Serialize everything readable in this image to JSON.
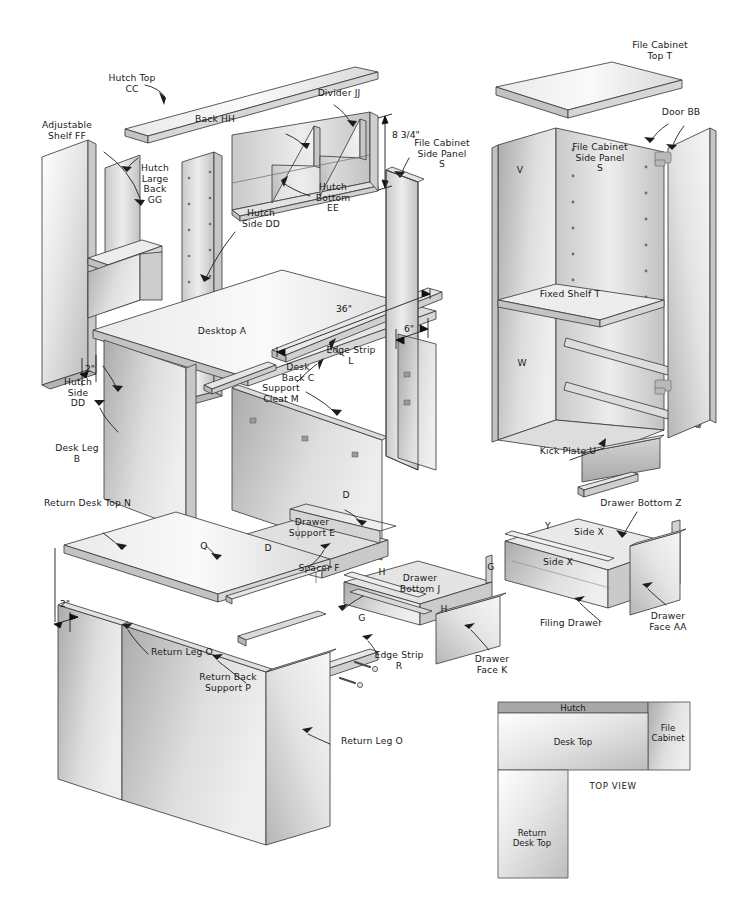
{
  "document": {
    "title": "Desk Assembly Exploded View",
    "top_view_caption": "TOP VIEW"
  },
  "colors": {
    "ink": "#1a1a1a",
    "line": "#4a4a4a",
    "panel_light": "#f2f2f2",
    "panel_mid": "#d9d9d9",
    "panel_dark": "#b4b4b4",
    "background": "#ffffff"
  },
  "labels": {
    "hutch_top": "Hutch Top\nCC",
    "divider": "Divider JJ",
    "back": "Back HH",
    "adjustable_shelf": "Adjustable\nShelf FF",
    "hutch_large_back": "Hutch\nLarge\nBack\nGG",
    "hutch_side_dd_left": "Hutch\nSide\nDD",
    "hutch_side_dd_mid": "Hutch\nSide DD",
    "hutch_bottom": "Hutch\nBottom\nEE",
    "file_cabinet_top": "File Cabinet\nTop T",
    "file_cabinet_side_panel_left": "File Cabinet\nSide Panel\nS",
    "file_cabinet_side_panel_right": "File Cabinet\nSide Panel\nS",
    "door": "Door BB",
    "panel_v": "V",
    "panel_w": "W",
    "fixed_shelf": "Fixed Shelf T",
    "kick_plate": "Kick Plate U",
    "desktop": "Desktop A",
    "edge_strip_l": "Edge Strip\nL",
    "support_cleat": "Support\nCleat M",
    "desk_back": "Desk\nBack C",
    "desk_leg": "Desk Leg\nB",
    "return_desk_top": "Return Desk Top N",
    "label_q": "Q",
    "return_leg_o_upper": "Return Leg O",
    "return_back_support": "Return Back\nSupport P",
    "return_leg_o_lower": "Return Leg O",
    "drawer_support": "Drawer\nSupport E",
    "label_d_top": "D",
    "label_d_side": "D",
    "spacer": "Spacer F",
    "drawer_bottom_j": "Drawer\nBottom J",
    "label_h_top": "H",
    "label_h_bottom": "H",
    "label_g_right": "G",
    "label_g_left": "G",
    "edge_strip_r": "Edge Strip\nR",
    "drawer_face_k": "Drawer\nFace K",
    "drawer_bottom_z": "Drawer Bottom Z",
    "side_x_upper": "Side X",
    "side_x_lower": "Side X",
    "label_y": "Y",
    "filing_drawer": "Filing Drawer",
    "drawer_face_aa": "Drawer\nFace AA"
  },
  "dimensions": {
    "hutch_opening_height": "8 3/4\"",
    "desktop_length": "36\"",
    "file_cabinet_gap": "6\"",
    "hutch_side_thickness": "2\"",
    "return_top_thickness": "2\""
  },
  "top_view": {
    "caption": "TOP VIEW",
    "parts": {
      "hutch": "Hutch",
      "desk_top": "Desk Top",
      "file_cabinet": "File\nCabinet",
      "return_desk_top": "Return\nDesk Top"
    }
  },
  "parts_list": [
    {
      "code": "A",
      "name": "Desktop"
    },
    {
      "code": "B",
      "name": "Desk Leg"
    },
    {
      "code": "C",
      "name": "Desk Back"
    },
    {
      "code": "D",
      "name": "Drawer Support side"
    },
    {
      "code": "E",
      "name": "Drawer Support"
    },
    {
      "code": "F",
      "name": "Spacer"
    },
    {
      "code": "G",
      "name": "Drawer side rail"
    },
    {
      "code": "H",
      "name": "Drawer side"
    },
    {
      "code": "J",
      "name": "Drawer Bottom"
    },
    {
      "code": "K",
      "name": "Drawer Face"
    },
    {
      "code": "L",
      "name": "Edge Strip"
    },
    {
      "code": "M",
      "name": "Support Cleat"
    },
    {
      "code": "N",
      "name": "Return Desk Top"
    },
    {
      "code": "O",
      "name": "Return Leg"
    },
    {
      "code": "P",
      "name": "Return Back Support"
    },
    {
      "code": "Q",
      "name": "Return edge"
    },
    {
      "code": "R",
      "name": "Edge Strip"
    },
    {
      "code": "S",
      "name": "File Cabinet Side Panel"
    },
    {
      "code": "T",
      "name": "File Cabinet Top / Fixed Shelf"
    },
    {
      "code": "U",
      "name": "Kick Plate"
    },
    {
      "code": "V",
      "name": "File Cabinet panel"
    },
    {
      "code": "W",
      "name": "File Cabinet panel"
    },
    {
      "code": "X",
      "name": "Drawer Side"
    },
    {
      "code": "Y",
      "name": "Drawer back"
    },
    {
      "code": "Z",
      "name": "Drawer Bottom"
    },
    {
      "code": "AA",
      "name": "Drawer Face"
    },
    {
      "code": "BB",
      "name": "Door"
    },
    {
      "code": "CC",
      "name": "Hutch Top"
    },
    {
      "code": "DD",
      "name": "Hutch Side"
    },
    {
      "code": "EE",
      "name": "Hutch Bottom"
    },
    {
      "code": "FF",
      "name": "Adjustable Shelf"
    },
    {
      "code": "GG",
      "name": "Hutch Large Back"
    },
    {
      "code": "HH",
      "name": "Back"
    },
    {
      "code": "JJ",
      "name": "Divider"
    }
  ]
}
